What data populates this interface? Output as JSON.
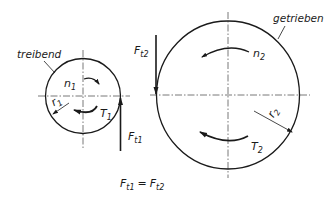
{
  "diagram": {
    "driving_gear": {
      "label": "treibend",
      "speed": {
        "main": "n",
        "sub": "1"
      },
      "torque": {
        "main": "T",
        "sub": "1"
      },
      "radius": {
        "main": "r",
        "sub": "1"
      },
      "force": {
        "main": "F",
        "sub": "t1"
      }
    },
    "driven_gear": {
      "label": "getrieben",
      "speed": {
        "main": "n",
        "sub": "2"
      },
      "torque": {
        "main": "T",
        "sub": "2"
      },
      "radius": {
        "main": "r",
        "sub": "2"
      },
      "force": {
        "main": "F",
        "sub": "t2"
      }
    },
    "equation": {
      "left": {
        "main": "F",
        "sub": "t1"
      },
      "operator": "=",
      "right": {
        "main": "F",
        "sub": "t2"
      }
    },
    "colors": {
      "line": "#1a1a1a",
      "centerline": "#555555",
      "background": "#ffffff"
    }
  }
}
